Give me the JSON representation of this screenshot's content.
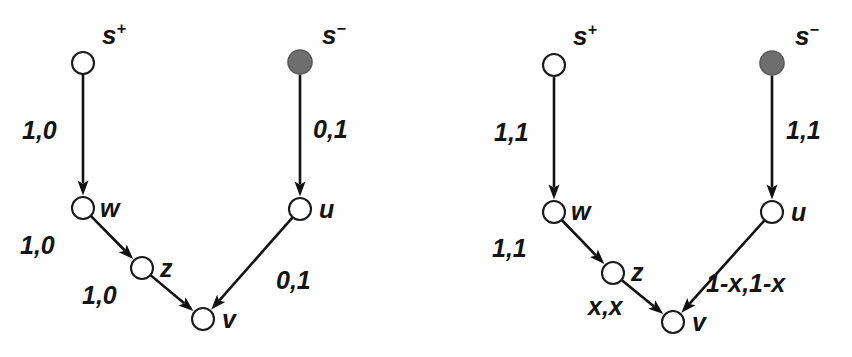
{
  "figure": {
    "background_color": "#fefefe",
    "ink_color": "#111111",
    "filled_node_color": "#6e6e6e",
    "open_node_color": "#ffffff"
  },
  "diagrams": [
    {
      "id": "left-diagram",
      "name": "left-network",
      "nodes": [
        {
          "id": "splus",
          "label": "s",
          "superscript": "+",
          "style": "open",
          "cx": 83,
          "cy": 63,
          "r": 11,
          "label_x": 102,
          "label_y": 22
        },
        {
          "id": "sminus",
          "label": "s",
          "superscript": "−",
          "style": "filled",
          "cx": 300,
          "cy": 62,
          "r": 12,
          "label_x": 322,
          "label_y": 22
        },
        {
          "id": "w",
          "label": "w",
          "superscript": "",
          "style": "open",
          "cx": 83,
          "cy": 208,
          "r": 11,
          "label_x": 100,
          "label_y": 196
        },
        {
          "id": "z",
          "label": "z",
          "superscript": "",
          "style": "open",
          "cx": 142,
          "cy": 268,
          "r": 11,
          "label_x": 160,
          "label_y": 256
        },
        {
          "id": "u",
          "label": "u",
          "superscript": "",
          "style": "open",
          "cx": 300,
          "cy": 209,
          "r": 11,
          "label_x": 319,
          "label_y": 197
        },
        {
          "id": "v",
          "label": "v",
          "superscript": "",
          "style": "open",
          "cx": 203,
          "cy": 319,
          "r": 11,
          "label_x": 222,
          "label_y": 307
        }
      ],
      "edges": [
        {
          "id": "splus-w",
          "from": "splus",
          "to": "w",
          "label": "1,0",
          "label_x": 22,
          "label_y": 118
        },
        {
          "id": "sminus-u",
          "from": "sminus",
          "to": "u",
          "label": "0,1",
          "label_x": 313,
          "label_y": 117
        },
        {
          "id": "w-z",
          "from": "w",
          "to": "z",
          "label": "1,0",
          "label_x": 20,
          "label_y": 233
        },
        {
          "id": "z-v",
          "from": "z",
          "to": "v",
          "label": "1,0",
          "label_x": 82,
          "label_y": 283
        },
        {
          "id": "u-v",
          "from": "u",
          "to": "v",
          "label": "0,1",
          "label_x": 276,
          "label_y": 268
        }
      ]
    },
    {
      "id": "right-diagram",
      "name": "right-network",
      "nodes": [
        {
          "id": "splus",
          "label": "s",
          "superscript": "+",
          "style": "open",
          "cx": 554,
          "cy": 65,
          "r": 11,
          "label_x": 573,
          "label_y": 23
        },
        {
          "id": "sminus",
          "label": "s",
          "superscript": "−",
          "style": "filled",
          "cx": 772,
          "cy": 63,
          "r": 12,
          "label_x": 795,
          "label_y": 23
        },
        {
          "id": "w",
          "label": "w",
          "superscript": "",
          "style": "open",
          "cx": 554,
          "cy": 212,
          "r": 11,
          "label_x": 571,
          "label_y": 199
        },
        {
          "id": "z",
          "label": "z",
          "superscript": "",
          "style": "open",
          "cx": 613,
          "cy": 273,
          "r": 11,
          "label_x": 631,
          "label_y": 260
        },
        {
          "id": "u",
          "label": "u",
          "superscript": "",
          "style": "open",
          "cx": 772,
          "cy": 212,
          "r": 11,
          "label_x": 791,
          "label_y": 200
        },
        {
          "id": "v",
          "label": "v",
          "superscript": "",
          "style": "open",
          "cx": 673,
          "cy": 322,
          "r": 11,
          "label_x": 692,
          "label_y": 310
        }
      ],
      "edges": [
        {
          "id": "splus-w",
          "from": "splus",
          "to": "w",
          "label": "1,1",
          "label_x": 494,
          "label_y": 120
        },
        {
          "id": "sminus-u",
          "from": "sminus",
          "to": "u",
          "label": "1,1",
          "label_x": 786,
          "label_y": 118
        },
        {
          "id": "w-z",
          "from": "w",
          "to": "z",
          "label": "1,1",
          "label_x": 492,
          "label_y": 236
        },
        {
          "id": "z-v",
          "from": "z",
          "to": "v",
          "label": "x,x",
          "label_x": 588,
          "label_y": 294
        },
        {
          "id": "u-v",
          "from": "u",
          "to": "v",
          "label": "1-x,1-x",
          "label_x": 706,
          "label_y": 271
        }
      ]
    }
  ]
}
